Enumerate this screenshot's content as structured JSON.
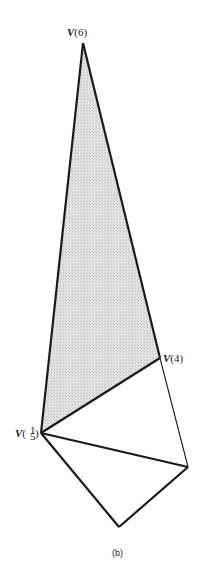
{
  "figure": {
    "caption": "(b)",
    "vertices": {
      "top": {
        "label": "V(6)",
        "x": 83,
        "y": 43
      },
      "right_upper": {
        "label": "V(4)",
        "x": 160,
        "y": 358
      },
      "left": {
        "label": "V(1/5)",
        "label_digit_a": "1",
        "label_digit_b": "5",
        "x": 41,
        "y": 433
      },
      "right_lower": {
        "label": "",
        "x": 188,
        "y": 467
      },
      "bottom": {
        "label": "",
        "x": 119,
        "y": 527
      }
    },
    "labels": {
      "v6": {
        "prefix": "V",
        "text": "(6)"
      },
      "v4": {
        "prefix": "V",
        "text": "(4)"
      },
      "v15": {
        "prefix": "V",
        "open": "(",
        "d1": "1",
        "d2": "5",
        "close": ")"
      }
    },
    "shaded_region": "triangle V(6)-V(4)-V(1/5)",
    "colors": {
      "stroke": "#1a1a1a",
      "shade": "#d9d9d9"
    }
  }
}
